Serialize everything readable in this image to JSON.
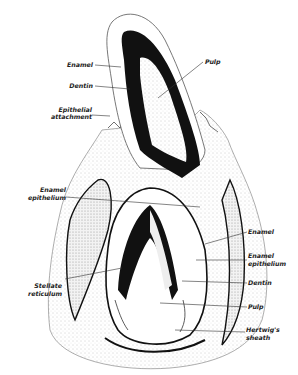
{
  "figure": {
    "labels_left": [
      {
        "id": "enamel-top",
        "text": "Enamel"
      },
      {
        "id": "dentin-top",
        "text": "Dentin"
      },
      {
        "id": "epithelial-attachment-1",
        "text": "Epithelial"
      },
      {
        "id": "epithelial-attachment-2",
        "text": "attachment"
      },
      {
        "id": "enamel-epithelium-left-1",
        "text": "Enamel"
      },
      {
        "id": "enamel-epithelium-left-2",
        "text": "epithelium"
      },
      {
        "id": "stellate-reticulum-1",
        "text": "Stellate"
      },
      {
        "id": "stellate-reticulum-2",
        "text": "reticulum"
      }
    ],
    "labels_right": [
      {
        "id": "pulp-top",
        "text": "Pulp"
      },
      {
        "id": "enamel-bottom",
        "text": "Enamel"
      },
      {
        "id": "enamel-epithelium-right-1",
        "text": "Enamel"
      },
      {
        "id": "enamel-epithelium-right-2",
        "text": "epithelium"
      },
      {
        "id": "dentin-bottom",
        "text": "Dentin"
      },
      {
        "id": "pulp-bottom",
        "text": "Pulp"
      },
      {
        "id": "hertwigs-sheath-1",
        "text": "Hertwig's"
      },
      {
        "id": "hertwigs-sheath-2",
        "text": "sheath"
      }
    ],
    "colors": {
      "ink": "#111111",
      "tissue": "#d9d9d9",
      "background": "#ffffff"
    }
  }
}
